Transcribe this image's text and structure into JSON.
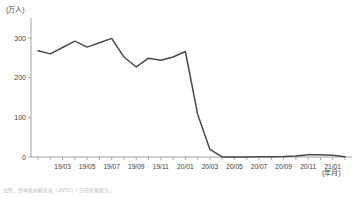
{
  "axis": {
    "y_unit_label": "(万人)",
    "x_unit_label": "(年月)",
    "y_ticks": [
      "0",
      "100",
      "200",
      "300"
    ],
    "x_ticks": [
      "19/03",
      "19/05",
      "19/07",
      "19/09",
      "19/11",
      "20/01",
      "20/03",
      "20/05",
      "20/07",
      "20/09",
      "20/11",
      "21/01"
    ]
  },
  "source": {
    "note": "出所：日本政府観光局（JNTO）「訪日外客統計」"
  },
  "chart_data": {
    "type": "line",
    "title": "",
    "subtitle": "",
    "xlabel": "(年月)",
    "ylabel": "(万人)",
    "ylim": [
      0,
      330
    ],
    "grid": false,
    "legend": "none",
    "x": [
      "19/01",
      "19/02",
      "19/03",
      "19/04",
      "19/05",
      "19/06",
      "19/07",
      "19/08",
      "19/09",
      "19/10",
      "19/11",
      "19/12",
      "20/01",
      "20/02",
      "20/03",
      "20/04",
      "20/05",
      "20/06",
      "20/07",
      "20/08",
      "20/09",
      "20/10",
      "20/11",
      "20/12",
      "21/01",
      "21/02"
    ],
    "x_tick_labels": [
      "19/03",
      "19/05",
      "19/07",
      "19/09",
      "19/11",
      "20/01",
      "20/03",
      "20/05",
      "20/07",
      "20/09",
      "20/11",
      "21/01"
    ],
    "series": [
      {
        "name": "訪日外客数",
        "values": [
          268,
          260,
          276,
          292,
          277,
          288,
          299,
          252,
          227,
          249,
          244,
          252,
          266,
          108,
          19,
          0.3,
          0.2,
          0.3,
          0.4,
          0.9,
          1.4,
          2.7,
          5.7,
          5.9,
          4.6,
          0.8
        ]
      }
    ],
    "annotations": []
  }
}
